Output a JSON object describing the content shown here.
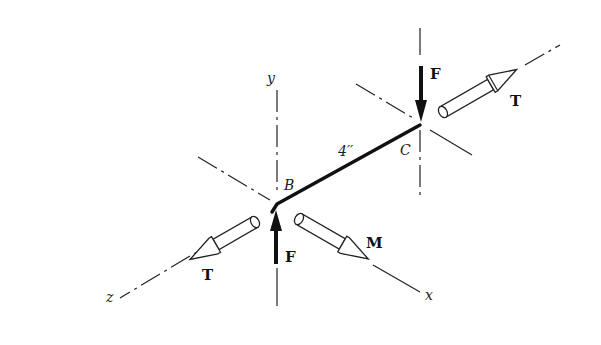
{
  "diagram": {
    "axes": {
      "y_label": "y",
      "x_label": "x",
      "z_label": "z"
    },
    "points": {
      "B_label": "B",
      "C_label": "C"
    },
    "bar": {
      "length_label": "4′′"
    },
    "loads": {
      "force_at_B_label": "F",
      "force_at_C_label": "F",
      "torque_at_B_label": "T",
      "torque_at_C_label": "T",
      "moment_label": "M"
    },
    "colors": {
      "ink": "#111111",
      "background": "#ffffff"
    }
  }
}
